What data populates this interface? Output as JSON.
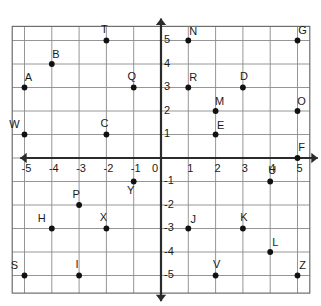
{
  "figure": {
    "type": "scatter"
  },
  "colors": {
    "background": "#ffffff",
    "grid": "#8a8a8a",
    "frame": "#6d6d6d",
    "axis": "#2b2b2b",
    "point": "#111111",
    "text": "#1a1a1a"
  },
  "chart_data": {
    "type": "scatter",
    "title": "",
    "xlabel": "",
    "ylabel": "",
    "xlim": [
      -6,
      6
    ],
    "ylim": [
      -6,
      6
    ],
    "grid": true,
    "legend": "none",
    "x_ticks": [
      "-5",
      "-4",
      "-3",
      "-2",
      "-1",
      "0",
      "1",
      "2",
      "3",
      "4",
      "5"
    ],
    "x_tick_values": [
      -5,
      -4,
      -3,
      -2,
      -1,
      0,
      1,
      2,
      3,
      4,
      5
    ],
    "y_ticks": [
      "5",
      "4",
      "3",
      "2",
      "1",
      "0",
      "-1",
      "-2",
      "-3",
      "-4",
      "-5"
    ],
    "y_tick_values": [
      5,
      4,
      3,
      2,
      1,
      0,
      -1,
      -2,
      -3,
      -4,
      -5
    ],
    "origin_label": "0",
    "points": [
      {
        "label": "A",
        "x": -5,
        "y": 3,
        "label_dx": 4,
        "label_dy": -9
      },
      {
        "label": "B",
        "x": -4,
        "y": 4,
        "label_dx": 4,
        "label_dy": -9
      },
      {
        "label": "C",
        "x": -2,
        "y": 1,
        "label_dx": -2,
        "label_dy": -10
      },
      {
        "label": "D",
        "x": 3,
        "y": 3,
        "label_dx": 1,
        "label_dy": -10
      },
      {
        "label": "E",
        "x": 2,
        "y": 1,
        "label_dx": 5,
        "label_dy": -8
      },
      {
        "label": "F",
        "x": 5,
        "y": 0,
        "label_dx": 4,
        "label_dy": -10
      },
      {
        "label": "G",
        "x": 5,
        "y": 5,
        "label_dx": 5,
        "label_dy": -9
      },
      {
        "label": "H",
        "x": -4,
        "y": -3,
        "label_dx": -10,
        "label_dy": -9
      },
      {
        "label": "I",
        "x": -3,
        "y": -5,
        "label_dx": -2,
        "label_dy": -10
      },
      {
        "label": "J",
        "x": 1,
        "y": -3,
        "label_dx": 5,
        "label_dy": -8
      },
      {
        "label": "K",
        "x": 3,
        "y": -3,
        "label_dx": 1,
        "label_dy": -10
      },
      {
        "label": "L",
        "x": 4,
        "y": -4,
        "label_dx": 5,
        "label_dy": -9
      },
      {
        "label": "M",
        "x": 2,
        "y": 2,
        "label_dx": 4,
        "label_dy": -9
      },
      {
        "label": "N",
        "x": 1,
        "y": 5,
        "label_dx": 5,
        "label_dy": -8
      },
      {
        "label": "O",
        "x": 5,
        "y": 2,
        "label_dx": 4,
        "label_dy": -9
      },
      {
        "label": "P",
        "x": -3,
        "y": -2,
        "label_dx": -3,
        "label_dy": -10
      },
      {
        "label": "Q",
        "x": -1,
        "y": 3,
        "label_dx": -2,
        "label_dy": -10
      },
      {
        "label": "R",
        "x": 1,
        "y": 3,
        "label_dx": 5,
        "label_dy": -9
      },
      {
        "label": "S",
        "x": -5,
        "y": -5,
        "label_dx": -10,
        "label_dy": -9
      },
      {
        "label": "T",
        "x": -2,
        "y": 5,
        "label_dx": -2,
        "label_dy": -10
      },
      {
        "label": "U",
        "x": 4,
        "y": -1,
        "label_dx": 2,
        "label_dy": -10
      },
      {
        "label": "V",
        "x": 2,
        "y": -5,
        "label_dx": 1,
        "label_dy": -10
      },
      {
        "label": "W",
        "x": -5,
        "y": 1,
        "label_dx": -10,
        "label_dy": -9
      },
      {
        "label": "X",
        "x": -2,
        "y": -3,
        "label_dx": -3,
        "label_dy": -10
      },
      {
        "label": "Y",
        "x": -1,
        "y": -1,
        "label_dx": -3,
        "label_dy": 10
      },
      {
        "label": "Z",
        "x": 5,
        "y": -5,
        "label_dx": 5,
        "label_dy": -9
      }
    ]
  }
}
